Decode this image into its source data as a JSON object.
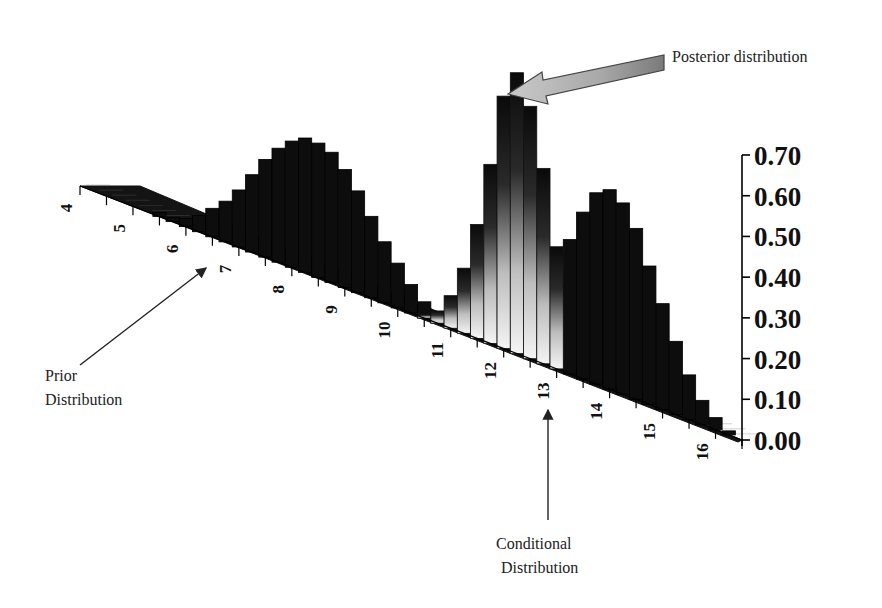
{
  "chart_data": {
    "type": "bar",
    "subtype": "3d-perspective-histogram",
    "title": "",
    "xlabel": "",
    "ylabel": "",
    "x_ticks": [
      "4",
      "5",
      "6",
      "7",
      "8",
      "9",
      "10",
      "11",
      "12",
      "13",
      "14",
      "15",
      "16"
    ],
    "y_ticks": [
      "0.00",
      "0.10",
      "0.20",
      "0.30",
      "0.40",
      "0.50",
      "0.60",
      "0.70"
    ],
    "ylim": [
      0,
      0.7
    ],
    "xlim": [
      4,
      16.5
    ],
    "grid": false,
    "legend": "none",
    "series": [
      {
        "name": "Prior Distribution",
        "style": "solid-dark",
        "x": [
          4.0,
          4.25,
          4.5,
          4.75,
          5.0,
          5.25,
          5.5,
          5.75,
          6.0,
          6.25,
          6.5,
          6.75,
          7.0,
          7.25,
          7.5,
          7.75,
          8.0,
          8.25,
          8.5,
          8.75,
          9.0,
          9.25,
          9.5,
          9.75,
          10.0,
          10.25,
          10.5,
          10.75
        ],
        "values": [
          0.0,
          0.0,
          0.0,
          0.0,
          0.0,
          0.0,
          0.01,
          0.01,
          0.02,
          0.04,
          0.07,
          0.1,
          0.14,
          0.19,
          0.24,
          0.28,
          0.31,
          0.33,
          0.33,
          0.32,
          0.29,
          0.25,
          0.2,
          0.15,
          0.11,
          0.07,
          0.04,
          0.02
        ]
      },
      {
        "name": "Posterior distribution",
        "style": "gradient-light",
        "x": [
          10.5,
          10.75,
          11.0,
          11.25,
          11.5,
          11.75,
          12.0,
          12.25,
          12.5,
          12.75,
          13.0
        ],
        "values": [
          0.01,
          0.03,
          0.08,
          0.16,
          0.28,
          0.44,
          0.62,
          0.69,
          0.62,
          0.48,
          0.3
        ]
      },
      {
        "name": "Conditional Distribution",
        "style": "solid-dark",
        "x": [
          12.5,
          12.75,
          13.0,
          13.25,
          13.5,
          13.75,
          14.0,
          14.25,
          14.5,
          14.75,
          15.0,
          15.25,
          15.5,
          15.75,
          16.0,
          16.25,
          16.5
        ],
        "values": [
          0.06,
          0.13,
          0.23,
          0.33,
          0.41,
          0.47,
          0.49,
          0.47,
          0.42,
          0.34,
          0.26,
          0.18,
          0.11,
          0.06,
          0.03,
          0.01,
          0.0
        ]
      }
    ],
    "annotations": [
      {
        "text": "Posterior distribution",
        "points_to": "Posterior distribution peak",
        "style": "block-arrow"
      },
      {
        "text": "Prior Distribution",
        "points_to": "x ≈ 7",
        "style": "line-arrow"
      },
      {
        "text": "Conditional Distribution",
        "points_to": "x ≈ 13.5",
        "style": "line-arrow"
      }
    ]
  },
  "annotations": {
    "posterior": "Posterior distribution",
    "prior_line1": "Prior",
    "prior_line2": "Distribution",
    "conditional_line1": "Conditional",
    "conditional_line2": "Distribution"
  }
}
